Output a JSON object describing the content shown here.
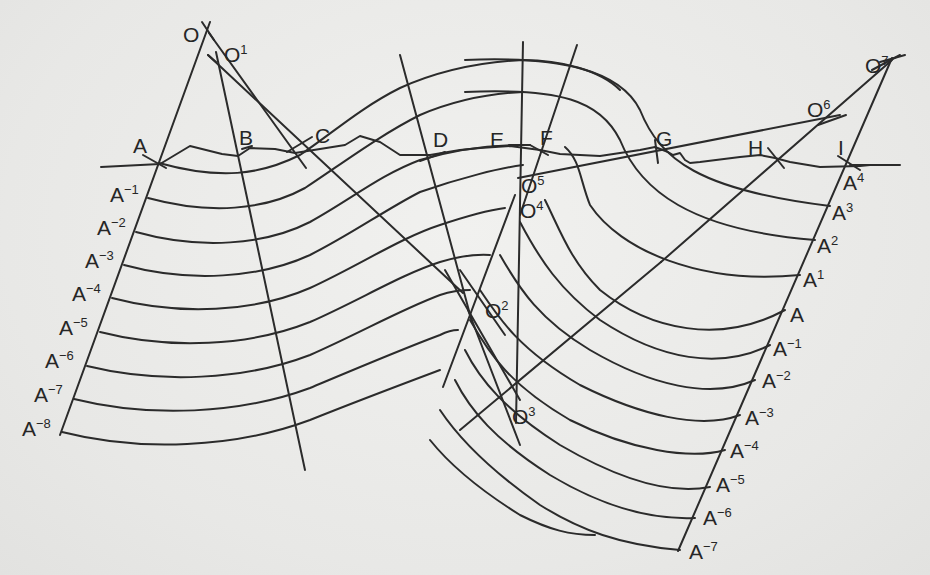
{
  "figure": {
    "type": "geological cross-section construction (arc method)",
    "surface_points": [
      "A",
      "B",
      "C",
      "D",
      "E",
      "F",
      "G",
      "H",
      "I"
    ],
    "centers": [
      "O",
      "O1",
      "O2",
      "O3",
      "O4",
      "O5",
      "O6",
      "O7"
    ],
    "left_scale": [
      "A",
      "A-1",
      "A-2",
      "A-3",
      "A-4",
      "A-5",
      "A-6",
      "A-7",
      "A-8"
    ],
    "right_scale": [
      "A4",
      "A3",
      "A2",
      "A1",
      "A",
      "A-1",
      "A-2",
      "A-3",
      "A-4",
      "A-5",
      "A-6",
      "A-7"
    ],
    "line_color": "#2b2b2b",
    "paper_color": "#ebebe9"
  },
  "labels": {
    "O": {
      "base": "O",
      "sup": ""
    },
    "O1": {
      "base": "O",
      "sup": "1"
    },
    "O2": {
      "base": "O",
      "sup": "2"
    },
    "O3": {
      "base": "O",
      "sup": "3"
    },
    "O4": {
      "base": "O",
      "sup": "4"
    },
    "O5": {
      "base": "O",
      "sup": "5"
    },
    "O6": {
      "base": "O",
      "sup": "6"
    },
    "O7": {
      "base": "O",
      "sup": "7"
    },
    "A": "A",
    "B": "B",
    "C": "C",
    "D": "D",
    "E": "E",
    "F": "F",
    "G": "G",
    "H": "H",
    "I": "I",
    "L0": {
      "base": "A",
      "sup": ""
    },
    "L1": {
      "base": "A",
      "sup": "−1"
    },
    "L2": {
      "base": "A",
      "sup": "−2"
    },
    "L3": {
      "base": "A",
      "sup": "−3"
    },
    "L4": {
      "base": "A",
      "sup": "−4"
    },
    "L5": {
      "base": "A",
      "sup": "−5"
    },
    "L6": {
      "base": "A",
      "sup": "−6"
    },
    "L7": {
      "base": "A",
      "sup": "−7"
    },
    "L8": {
      "base": "A",
      "sup": "−8"
    },
    "R4": {
      "base": "A",
      "sup": "4"
    },
    "R3": {
      "base": "A",
      "sup": "3"
    },
    "R2": {
      "base": "A",
      "sup": "2"
    },
    "R1": {
      "base": "A",
      "sup": "1"
    },
    "R0": {
      "base": "A",
      "sup": ""
    },
    "Rm1": {
      "base": "A",
      "sup": "−1"
    },
    "Rm2": {
      "base": "A",
      "sup": "−2"
    },
    "Rm3": {
      "base": "A",
      "sup": "−3"
    },
    "Rm4": {
      "base": "A",
      "sup": "−4"
    },
    "Rm5": {
      "base": "A",
      "sup": "−5"
    },
    "Rm6": {
      "base": "A",
      "sup": "−6"
    },
    "Rm7": {
      "base": "A",
      "sup": "−7"
    }
  }
}
